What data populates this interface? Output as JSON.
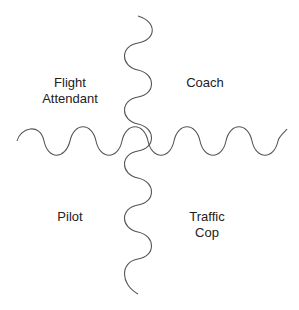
{
  "diagram": {
    "type": "quadrant",
    "axes": {
      "vertical": "wavy-line",
      "horizontal": "wavy-line",
      "stroke_color": "#555555"
    },
    "quadrants": {
      "top_left": {
        "line1": "Flight",
        "line2": "Attendant"
      },
      "top_right": {
        "line1": "Coach"
      },
      "bottom_left": {
        "line1": "Pilot"
      },
      "bottom_right": {
        "line1": "Traffic",
        "line2": "Cop"
      }
    }
  }
}
